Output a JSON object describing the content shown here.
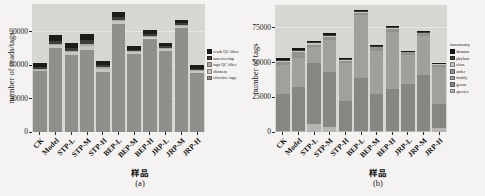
{
  "chart_data": [
    {
      "type": "bar",
      "stacked": true,
      "caption": "(a)",
      "xlabel": "样品",
      "ylabel": "number of reads/tags",
      "ylim": [
        0,
        115000
      ],
      "yticks": [
        0,
        30000,
        60000,
        90000
      ],
      "grid": true,
      "legend_title": "",
      "legend_position": "right",
      "categories": [
        "CK",
        "Model",
        "STP-L",
        "STP-M",
        "STP-H",
        "BEP-L",
        "BEP-M",
        "BEP-H",
        "JRP-L",
        "JRP-M",
        "JRP-H"
      ],
      "series": [
        {
          "name": "effective tags",
          "color": "#8f8f8c",
          "values": [
            54500,
            75500,
            69000,
            74000,
            54000,
            97000,
            70000,
            84000,
            73000,
            93500,
            53000
          ]
        },
        {
          "name": "chimera",
          "color": "#c6c5c2",
          "values": [
            1500,
            2500,
            2500,
            3500,
            2500,
            2500,
            1500,
            1500,
            1500,
            1500,
            1500
          ]
        },
        {
          "name": "tags QC filter",
          "color": "#aaa9a6",
          "values": [
            1000,
            1500,
            1500,
            2000,
            1500,
            1500,
            1000,
            1000,
            1000,
            1000,
            1000
          ]
        },
        {
          "name": "non-overlap",
          "color": "#3d3d3a",
          "values": [
            1500,
            2500,
            2500,
            3000,
            2000,
            2000,
            1500,
            1500,
            1500,
            1500,
            1500
          ]
        },
        {
          "name": "reads QC filter",
          "color": "#1c1c1a",
          "values": [
            3500,
            5500,
            4500,
            5500,
            4000,
            4500,
            3000,
            3500,
            3000,
            3500,
            3000
          ]
        }
      ],
      "totals": [
        62000,
        87500,
        80000,
        88000,
        64000,
        107500,
        77000,
        91500,
        80000,
        101000,
        60000
      ]
    },
    {
      "type": "bar",
      "stacked": true,
      "caption": "(b)",
      "xlabel": "样品",
      "ylabel": "number of tags",
      "ylim": [
        0,
        91500
      ],
      "yticks": [
        0,
        25000,
        50000,
        75000
      ],
      "grid": true,
      "legend_title": "taxonomy",
      "legend_position": "right",
      "categories": [
        "CK",
        "Model",
        "STP-L",
        "STP-M",
        "STP-H",
        "BEP-L",
        "BEP-M",
        "BEP-H",
        "JRP-L",
        "JRP-M",
        "JRP-H"
      ],
      "series": [
        {
          "name": "species",
          "color": "#b6b5b2",
          "values": [
            500,
            1000,
            6000,
            3500,
            1000,
            1000,
            1000,
            1000,
            1000,
            1000,
            3000
          ]
        },
        {
          "name": "genus",
          "color": "#868683",
          "values": [
            27000,
            31500,
            44000,
            39500,
            21000,
            38000,
            26500,
            30000,
            33500,
            40000,
            17500
          ]
        },
        {
          "name": "family",
          "color": "#a1a09d",
          "values": [
            20500,
            21000,
            11000,
            23000,
            28000,
            45000,
            31000,
            41000,
            21000,
            28000,
            26000
          ]
        },
        {
          "name": "order",
          "color": "#93928f",
          "values": [
            2500,
            4000,
            2000,
            2500,
            1500,
            2000,
            2500,
            2500,
            2000,
            2000,
            2000
          ]
        },
        {
          "name": "class",
          "color": "#c4c3c0",
          "values": [
            1000,
            1000,
            1000,
            1000,
            800,
            800,
            800,
            800,
            500,
            700,
            600
          ]
        },
        {
          "name": "phylum",
          "color": "#3a3a37",
          "values": [
            500,
            500,
            500,
            500,
            400,
            400,
            400,
            400,
            250,
            300,
            300
          ]
        },
        {
          "name": "domain",
          "color": "#171715",
          "values": [
            1500,
            1500,
            1000,
            1000,
            300,
            800,
            800,
            800,
            250,
            500,
            600
          ]
        }
      ],
      "totals": [
        53500,
        60500,
        65500,
        71000,
        53000,
        88000,
        63000,
        76500,
        58500,
        72500,
        50000
      ]
    }
  ]
}
